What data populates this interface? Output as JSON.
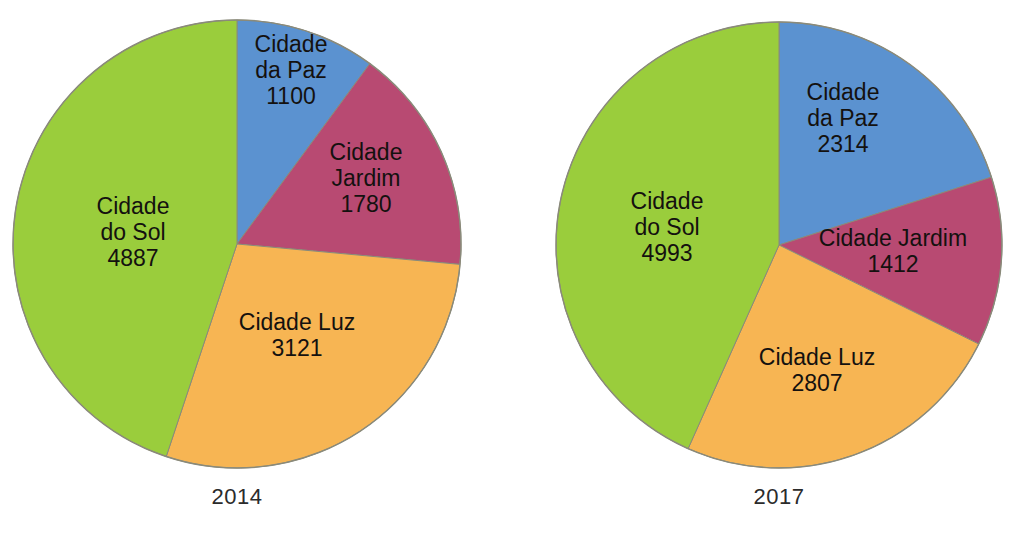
{
  "figure": {
    "background_color": "#ffffff",
    "label_text_color": "#14110f",
    "caption_text_color": "#2b2b2b",
    "outline_color": "#8a8a7a"
  },
  "palette": {
    "cidade_da_paz": "#5B92D0",
    "cidade_jardim": "#B84A72",
    "cidade_luz": "#F7B553",
    "cidade_do_sol": "#9ACD3C"
  },
  "chart_data": [
    {
      "type": "pie",
      "title": "2014",
      "caption": "2014",
      "total": 10888,
      "start_angle_deg": 0,
      "direction": "clockwise",
      "categories": [
        "Cidade da Paz",
        "Cidade Jardim",
        "Cidade Luz",
        "Cidade do Sol"
      ],
      "values": [
        1100,
        1780,
        3121,
        4887
      ],
      "slices": [
        {
          "name": "Cidade da Paz",
          "value": 1100,
          "color": "#5B92D0",
          "label_lines": [
            "Cidade",
            "da Paz",
            "1100"
          ],
          "label_x": 291,
          "label_y": 52
        },
        {
          "name": "Cidade Jardim",
          "value": 1780,
          "color": "#B84A72",
          "label_lines": [
            "Cidade",
            "Jardim",
            "1780"
          ],
          "label_x": 366,
          "label_y": 160
        },
        {
          "name": "Cidade Luz",
          "value": 3121,
          "color": "#F7B553",
          "label_lines": [
            "Cidade Luz",
            "3121"
          ],
          "label_x": 297,
          "label_y": 330
        },
        {
          "name": "Cidade do Sol",
          "value": 4887,
          "color": "#9ACD3C",
          "label_lines": [
            "Cidade",
            "do Sol",
            "4887"
          ],
          "label_x": 133,
          "label_y": 214
        }
      ]
    },
    {
      "type": "pie",
      "title": "2017",
      "caption": "2017",
      "total": 11526,
      "start_angle_deg": 0,
      "direction": "clockwise",
      "categories": [
        "Cidade da Paz",
        "Cidade Jardim",
        "Cidade Luz",
        "Cidade do Sol"
      ],
      "values": [
        2314,
        1412,
        2807,
        4993
      ],
      "slices": [
        {
          "name": "Cidade da Paz",
          "value": 2314,
          "color": "#5B92D0",
          "label_lines": [
            "Cidade",
            "da Paz",
            "2314"
          ],
          "label_x": 843,
          "label_y": 100
        },
        {
          "name": "Cidade Jardim",
          "value": 1412,
          "color": "#B84A72",
          "label_lines": [
            "Cidade Jardim",
            "1412"
          ],
          "label_x": 893,
          "label_y": 246
        },
        {
          "name": "Cidade Luz",
          "value": 2807,
          "color": "#F7B553",
          "label_lines": [
            "Cidade Luz",
            "2807"
          ],
          "label_x": 817,
          "label_y": 365
        },
        {
          "name": "Cidade do Sol",
          "value": 4993,
          "color": "#9ACD3C",
          "label_lines": [
            "Cidade",
            "do Sol",
            "4993"
          ],
          "label_x": 667,
          "label_y": 209
        }
      ]
    }
  ],
  "charts": [
    {
      "id": "pie-2014",
      "cx": 237,
      "cy": 244,
      "r": 224,
      "caption": "2014",
      "caption_left": 137,
      "caption_top": 484,
      "caption_width": 200
    },
    {
      "id": "pie-2017",
      "cx": 779,
      "cy": 245,
      "r": 223,
      "caption": "2017",
      "caption_left": 679,
      "caption_top": 484,
      "caption_width": 200
    }
  ]
}
